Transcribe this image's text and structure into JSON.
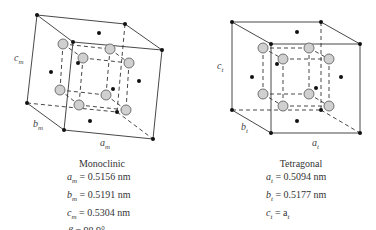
{
  "monoclinic": {
    "title": "Monoclinic",
    "axis_labels": {
      "a": "a",
      "a_sub": "m",
      "b": "b",
      "b_sub": "m",
      "c": "c",
      "c_sub": "m"
    },
    "params": [
      {
        "sym": "a",
        "sub": "m",
        "eq": " = 0.5156 nm"
      },
      {
        "sym": "b",
        "sub": "m",
        "eq": " = 0.5191 nm"
      },
      {
        "sym": "c",
        "sub": "m",
        "eq": " = 0.5304 nm"
      },
      {
        "sym": "β",
        "sub": "",
        "eq": " = 98.9°"
      }
    ]
  },
  "tetragonal": {
    "title": "Tetragonal",
    "axis_labels": {
      "a": "a",
      "a_sub": "t",
      "b": "b",
      "b_sub": "t",
      "c": "c",
      "c_sub": "t"
    },
    "params": [
      {
        "sym": "a",
        "sub": "t",
        "eq": " = 0.5094 nm"
      },
      {
        "sym": "b",
        "sub": "t",
        "eq": " = 0.5177 nm"
      },
      {
        "sym": "c",
        "sub": "t",
        "eq": " = a",
        "eq_sub": "t"
      }
    ]
  },
  "colors": {
    "line": "#333333",
    "large_atom_fill": "#d0d0d0",
    "large_atom_stroke": "#555555",
    "small_atom": "#111111"
  }
}
